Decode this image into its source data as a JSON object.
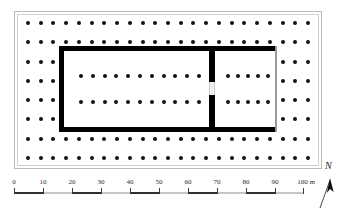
{
  "figure": {
    "kind": "archaeological-site-plan"
  },
  "plan": {
    "frame_label": "plan-frame",
    "colonnade": {
      "description": "double row of columns (dipteral peristyle) surrounding the cella",
      "outer_rows_top": 2,
      "outer_rows_bottom": 2,
      "outer_cols_left": 2,
      "outer_cols_right": 2,
      "grid_columns": 23,
      "grid_rows": 8
    },
    "cella": {
      "description": "rectangular cella with thick masonry walls, internal double colonnade, cross-wall with doorway and open east chamber",
      "interior_column_rows": 2,
      "interior_columns_per_row": 11,
      "doorway_label": "doorway"
    },
    "east_chamber": {
      "description": "eastern chamber (opisthodomos / adyton) bounded by a thin line on the east",
      "column_rows": 2,
      "columns_per_row": 5
    }
  },
  "scalebar": {
    "ticks": [
      {
        "value": "0",
        "position_m": 0
      },
      {
        "value": "10",
        "position_m": 10
      },
      {
        "value": "20",
        "position_m": 20
      },
      {
        "value": "30",
        "position_m": 30
      },
      {
        "value": "40",
        "position_m": 40
      },
      {
        "value": "50",
        "position_m": 50
      },
      {
        "value": "60",
        "position_m": 60
      },
      {
        "value": "70",
        "position_m": 70
      },
      {
        "value": "80",
        "position_m": 80
      },
      {
        "value": "90",
        "position_m": 90
      }
    ],
    "end_label": "100 m",
    "end_position_m": 100,
    "min_m": 0,
    "max_m": 100,
    "unit": "m"
  },
  "north_arrow": {
    "letter": "N"
  },
  "colors": {
    "wall": "#000000",
    "thin_wall": "#9a9a9a",
    "column": "#111111",
    "frame": "#b9b9b9",
    "background": "#ffffff",
    "scale_dark": "#2f2f2f",
    "scale_light": "#c6c6c6"
  }
}
